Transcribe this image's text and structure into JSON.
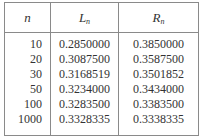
{
  "table": {
    "headers": [
      {
        "main": "n",
        "sub": ""
      },
      {
        "main": "L",
        "sub": "n"
      },
      {
        "main": "R",
        "sub": "n"
      }
    ],
    "rows": [
      {
        "n": "10",
        "L": "0.2850000",
        "R": "0.3850000"
      },
      {
        "n": "20",
        "L": "0.3087500",
        "R": "0.3587500"
      },
      {
        "n": "30",
        "L": "0.3168519",
        "R": "0.3501852"
      },
      {
        "n": "50",
        "L": "0.3234000",
        "R": "0.3434000"
      },
      {
        "n": "100",
        "L": "0.3283500",
        "R": "0.3383500"
      },
      {
        "n": "1000",
        "L": "0.3328335",
        "R": "0.3338335"
      }
    ]
  }
}
